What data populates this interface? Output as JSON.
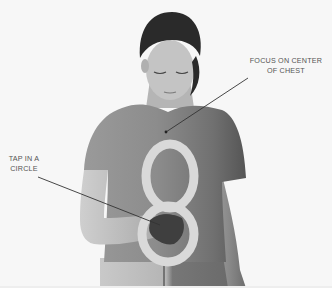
{
  "image": {
    "description": "Grayscale instructional photo: woman in short-sleeved t-shirt tapping her chest, with a figure-eight drawn on the shirt",
    "colors": {
      "background": "#f7f7f7",
      "shirt": "#8a8a8a",
      "shirt_shadow": "#5e5e5e",
      "skin": "#bdbdbd",
      "hair": "#2a2a2a",
      "figure_eight": "#d9d9d9",
      "pointer_line": "#333333",
      "label_text": "#555555"
    }
  },
  "annotations": {
    "chest": {
      "line1": "FOCUS ON CENTER",
      "line2": "OF CHEST"
    },
    "tap": {
      "line1": "TAP IN A",
      "line2": "CIRCLE"
    }
  }
}
